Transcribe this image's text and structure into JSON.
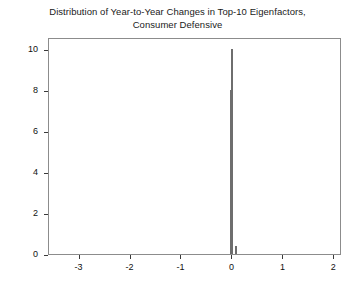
{
  "chart_data": {
    "type": "bar",
    "title": "Distribution of Year-to-Year Changes in Top-10 Eigenfactors, Consumer Defensive",
    "title_line1": "Distribution of Year-to-Year Changes in Top-10 Eigenfactors,",
    "title_line2": "Consumer Defensive",
    "xlabel": "",
    "ylabel": "",
    "xlim": [
      -3.6,
      2.15
    ],
    "ylim": [
      0,
      10.6
    ],
    "xticks": [
      -3,
      -2,
      -1,
      0,
      1,
      2
    ],
    "xtick_labels": [
      "-3",
      "-2",
      "-1",
      "0",
      "1",
      "2"
    ],
    "yticks": [
      0,
      2,
      4,
      6,
      8,
      10
    ],
    "ytick_labels": [
      "0",
      "2",
      "4",
      "6",
      "8",
      "10"
    ],
    "grid": false,
    "legend": false,
    "bin_centers": [
      -0.035,
      0.0,
      0.075
    ],
    "values": [
      8,
      10,
      0.4
    ],
    "bar_width": 0.028,
    "bar_fill_color": "#b9b9b9",
    "bar_edge_color": "#6e6e6e",
    "axis_color": "#8c8c8c",
    "bars": [
      {
        "label": "-0.035",
        "x": -0.035,
        "value": 8
      },
      {
        "label": "0.0",
        "x": 0.0,
        "value": 10
      },
      {
        "label": "0.075",
        "x": 0.075,
        "value": 0.4
      }
    ]
  }
}
